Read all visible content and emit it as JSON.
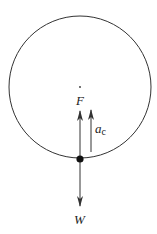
{
  "diagram": {
    "type": "free-body diagram, vertical circular motion at bottom of circle",
    "circle": {
      "cx": 80,
      "cy": 87,
      "r": 71
    },
    "center_point": {
      "x": 80,
      "y": 87
    },
    "object": {
      "x": 80,
      "y": 159
    },
    "labels": {
      "force_up": "F",
      "acceleration": "a",
      "acceleration_sub": "c",
      "weight": "W"
    },
    "colors": {
      "stroke": "#333333",
      "text": "#222222"
    }
  }
}
